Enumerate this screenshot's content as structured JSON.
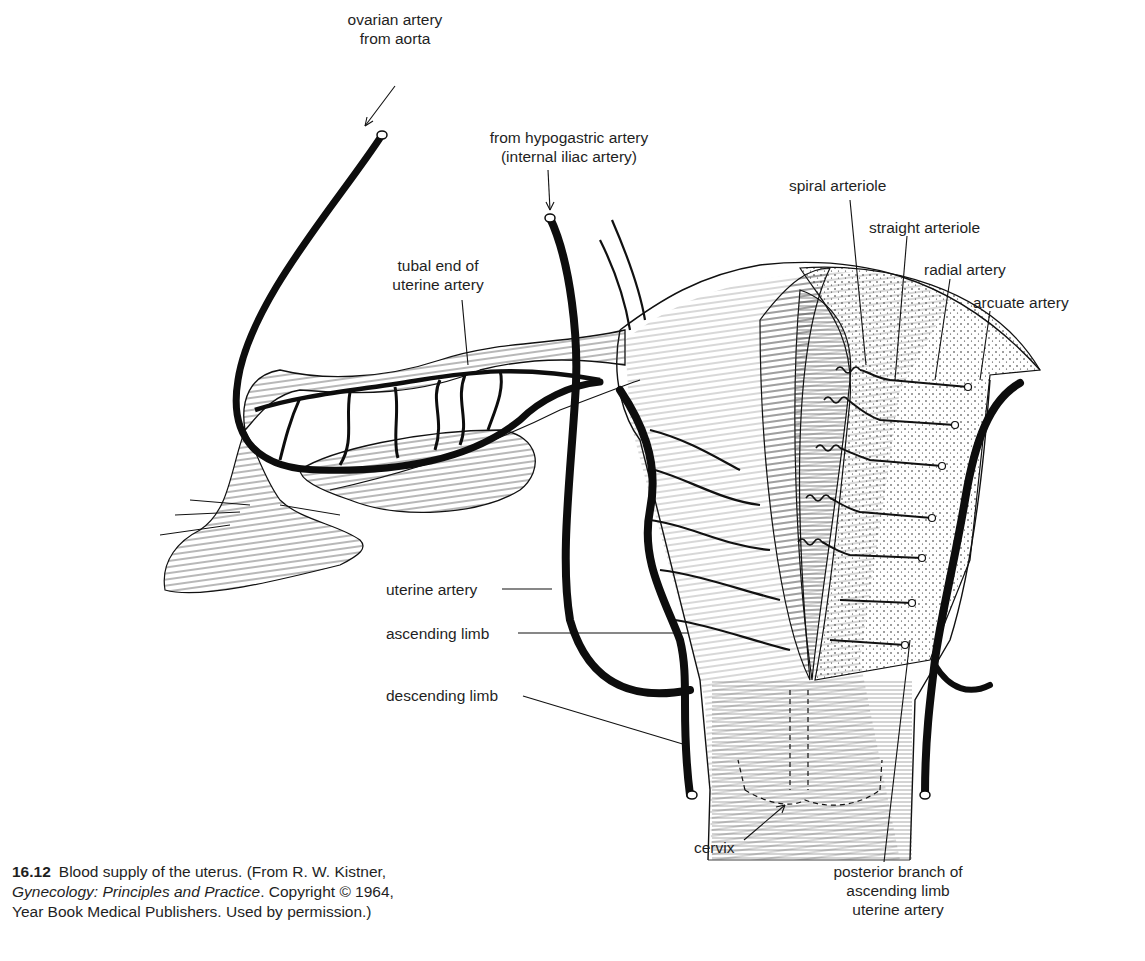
{
  "figure": {
    "number": "16.12",
    "caption_main": "Blood supply of the uterus. (From R. W. Kistner,",
    "caption_book": "Gynecology: Principles and Practice",
    "caption_rest1": ". Copyright © 1964,",
    "caption_line3": "Year Book Medical Publishers. Used by permission.)"
  },
  "labels": {
    "ovarian_artery": {
      "line1": "ovarian artery",
      "line2": "from aorta"
    },
    "hypogastric": {
      "line1": "from hypogastric artery",
      "line2": "(internal iliac artery)"
    },
    "tubal_end": {
      "line1": "tubal end of",
      "line2": "uterine artery"
    },
    "spiral_arteriole": "spiral arteriole",
    "straight_arteriole": "straight arteriole",
    "radial_artery": "radial artery",
    "arcuate_artery": "arcuate artery",
    "uterine_artery": "uterine artery",
    "ascending_limb": "ascending limb",
    "descending_limb": "descending limb",
    "cervix": "cervix",
    "posterior_branch": {
      "line1": "posterior branch of",
      "line2": "ascending limb",
      "line3": "uterine artery"
    }
  },
  "colors": {
    "ink": "#111111",
    "paper": "#ffffff"
  }
}
